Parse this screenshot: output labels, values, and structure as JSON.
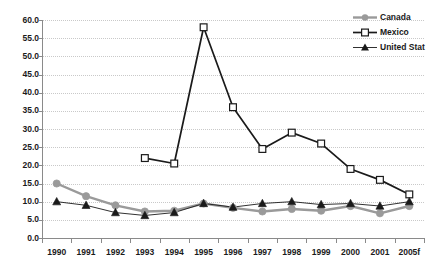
{
  "chart_data": {
    "type": "line",
    "title": "",
    "xlabel": "",
    "ylabel": "",
    "ylim": [
      0.0,
      60.0
    ],
    "ytick_step": 5.0,
    "grid": true,
    "legend_position": "top-right",
    "categories": [
      "1990",
      "1991",
      "1992",
      "1993",
      "1994",
      "1995",
      "1996",
      "1997",
      "1998",
      "1999",
      "2000",
      "2001",
      "2005f"
    ],
    "ytick_labels": [
      "60.0",
      "55.0",
      "50.0",
      "45.0",
      "40.0",
      "35.0",
      "30.0",
      "25.0",
      "20.0",
      "15.0",
      "10.0",
      "5.0",
      "0.0"
    ],
    "series": [
      {
        "name": "Canada",
        "color": "#9a9a9a",
        "marker": "circle",
        "values": [
          15.0,
          11.5,
          9.0,
          7.3,
          7.5,
          9.5,
          8.3,
          7.3,
          8.0,
          7.5,
          8.8,
          6.8,
          8.8
        ]
      },
      {
        "name": "Mexico",
        "color": "#1a1a1a",
        "marker": "open-square",
        "values": [
          null,
          null,
          null,
          22.0,
          20.5,
          58.0,
          36.0,
          24.5,
          29.0,
          26.0,
          19.0,
          16.0,
          12.0
        ]
      },
      {
        "name": "United Stat",
        "color": "#1a1a1a",
        "marker": "triangle",
        "values": [
          10.0,
          9.0,
          7.0,
          6.2,
          7.0,
          9.5,
          8.5,
          9.5,
          10.0,
          9.2,
          9.5,
          8.8,
          10.0
        ]
      }
    ]
  },
  "legend": {
    "items": [
      {
        "label": "Canada",
        "marker": "circle-marker-icon"
      },
      {
        "label": "Mexico",
        "marker": "open-square-marker-icon"
      },
      {
        "label": "United Stat",
        "marker": "triangle-marker-icon"
      }
    ]
  }
}
